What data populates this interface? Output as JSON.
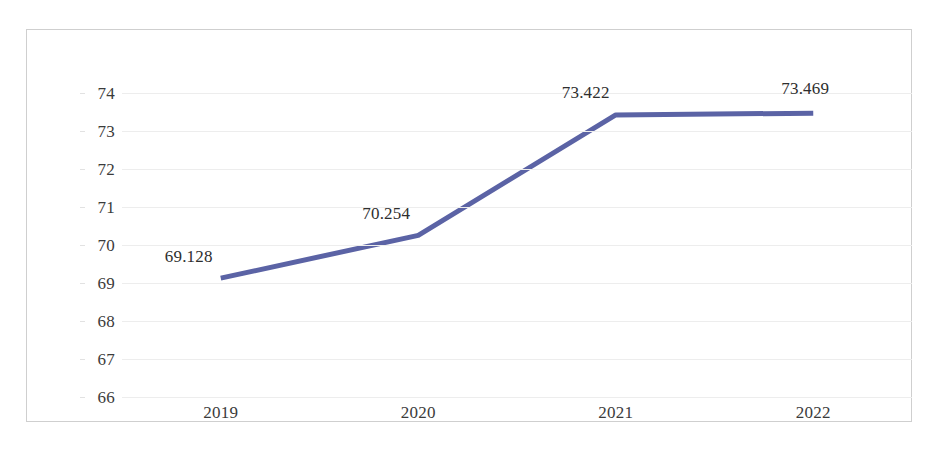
{
  "chart_data": {
    "type": "line",
    "title": "",
    "subtitle": "",
    "xlabel": "",
    "ylabel": "",
    "categories": [
      "2019",
      "2020",
      "2021",
      "2022"
    ],
    "series": [
      {
        "name": "series-1",
        "values": [
          69.128,
          70.254,
          73.422,
          73.469
        ],
        "color": "#5b63a5",
        "line_width": 5,
        "markers": false
      }
    ],
    "point_labels": [
      "69.128",
      "70.254",
      "73.422",
      "73.469"
    ],
    "ylim": [
      66,
      74
    ],
    "yticks": [
      66,
      67,
      68,
      69,
      70,
      71,
      72,
      73,
      74
    ],
    "ytick_labels": [
      "66",
      "67",
      "68",
      "69",
      "70",
      "71",
      "72",
      "73",
      "74"
    ],
    "xtick_labels": [
      "2019",
      "2020",
      "2021",
      "2022"
    ],
    "grid": {
      "horizontal": true,
      "vertical": false,
      "color": "#ededed"
    },
    "legend": {
      "visible": false,
      "position": "none"
    },
    "border_color": "#cfcfcf",
    "background": "#ffffff",
    "text_color": "#3b3b3b"
  }
}
